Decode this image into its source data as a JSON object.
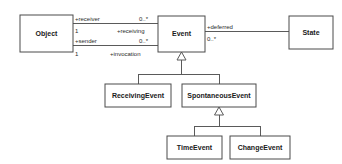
{
  "diagram": {
    "type": "uml-class-diagram",
    "title": "",
    "background_color": "#ffffff",
    "line_color": "#5a5a5a",
    "box_border_color": "#4a4a4a",
    "box_fill_color": "#ffffff",
    "text_color": "#1a1a1a",
    "classes": [
      {
        "id": "object",
        "name": "Object",
        "x": 20,
        "y": 15,
        "w": 53,
        "h": 37
      },
      {
        "id": "event",
        "name": "Event",
        "x": 158,
        "y": 16,
        "w": 47,
        "h": 36
      },
      {
        "id": "state",
        "name": "State",
        "x": 289,
        "y": 16,
        "w": 44,
        "h": 33
      },
      {
        "id": "receiving_event",
        "name": "ReceivingEvent",
        "x": 105,
        "y": 84,
        "w": 66,
        "h": 23
      },
      {
        "id": "spontaneous_event",
        "name": "SpontaneousEvent",
        "x": 182,
        "y": 84,
        "w": 74,
        "h": 23
      },
      {
        "id": "time_event",
        "name": "TimeEvent",
        "x": 167,
        "y": 136,
        "w": 55,
        "h": 23
      },
      {
        "id": "change_event",
        "name": "ChangeEvent",
        "x": 230,
        "y": 136,
        "w": 60,
        "h": 23
      }
    ],
    "associations": [
      {
        "id": "receiver-receiving",
        "from": "object",
        "to": "event",
        "source_role": "+receiver",
        "source_multiplicity": "1",
        "target_role": "+receiving",
        "target_multiplicity": "0..*"
      },
      {
        "id": "sender-invocation",
        "from": "object",
        "to": "event",
        "source_role": "+sender",
        "source_multiplicity": "1",
        "target_role": "+invocation",
        "target_multiplicity": "0..*"
      },
      {
        "id": "deferred",
        "from": "event",
        "to": "state",
        "source_role": "+deferred",
        "source_multiplicity": "0..*",
        "target_role": "",
        "target_multiplicity": ""
      }
    ],
    "generalizations": [
      {
        "id": "gen-event",
        "parent": "event",
        "children": [
          "receiving_event",
          "spontaneous_event"
        ]
      },
      {
        "id": "gen-spontaneous",
        "parent": "spontaneous_event",
        "children": [
          "time_event",
          "change_event"
        ]
      }
    ],
    "labels": {
      "receiver_role": "+receiver",
      "receiver_mult_source": "1",
      "receiving_role": "+receiving",
      "receiving_mult": "0..*",
      "sender_role": "+sender",
      "sender_mult_source": "1",
      "invocation_role": "+invocation",
      "invocation_mult": "0..*",
      "deferred_role": "+deferred",
      "deferred_mult": "0..*"
    },
    "class_names": {
      "object": "Object",
      "event": "Event",
      "state": "State",
      "receiving_event": "ReceivingEvent",
      "spontaneous_event": "SpontaneousEvent",
      "time_event": "TimeEvent",
      "change_event": "ChangeEvent"
    }
  }
}
